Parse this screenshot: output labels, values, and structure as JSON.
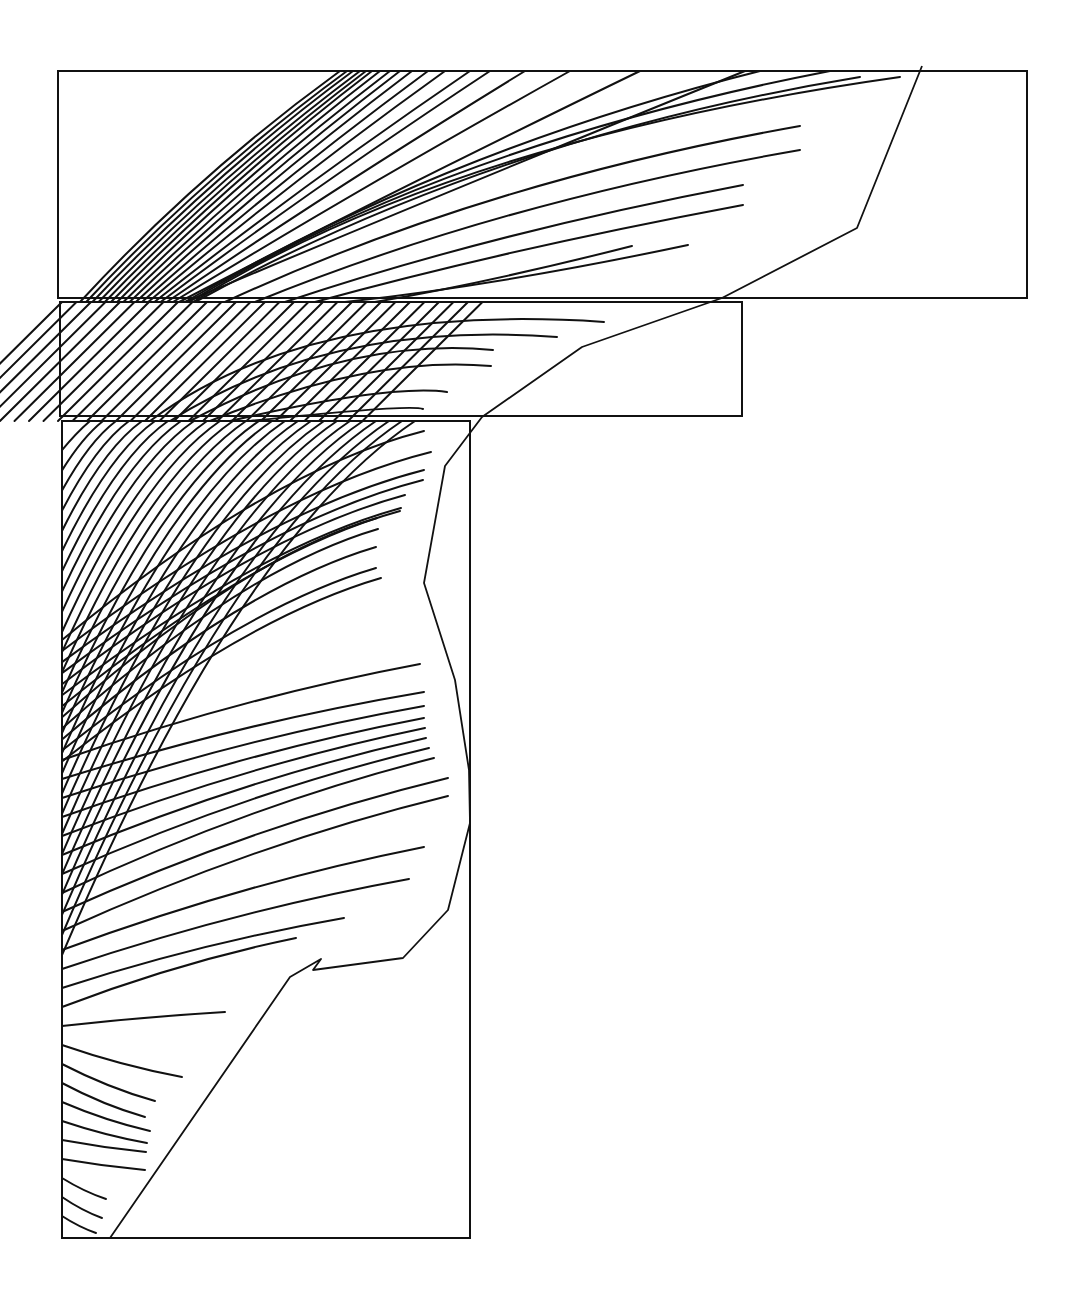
{
  "figure": {
    "type": "slip-line field / streamline diagram",
    "caption": "",
    "caption_visible": "truncated at bottom edge; text not legible",
    "stroke_color": "#111111",
    "background": "#ffffff"
  },
  "frames": [
    {
      "name": "top-block",
      "x": 58,
      "y": 71,
      "width": 969,
      "height": 227
    },
    {
      "name": "middle-block",
      "x": 60,
      "y": 302,
      "width": 682,
      "height": 114
    },
    {
      "name": "bottom-block",
      "x": 62,
      "y": 421,
      "width": 408,
      "height": 817
    }
  ],
  "boundary_polyline": [
    [
      922,
      66
    ],
    [
      857,
      228
    ],
    [
      722,
      298
    ],
    [
      582,
      347
    ],
    [
      482,
      417
    ],
    [
      445,
      466
    ],
    [
      424,
      583
    ],
    [
      455,
      680
    ],
    [
      469,
      770
    ],
    [
      470,
      823
    ],
    [
      448,
      910
    ],
    [
      403,
      958
    ],
    [
      313,
      970
    ],
    [
      321,
      959
    ],
    [
      290,
      977
    ],
    [
      110,
      1238
    ]
  ],
  "streamline_groups": {
    "top": {
      "count": 26,
      "origin_x_range": [
        78,
        210
      ],
      "origin_y": 302,
      "top_edge_hits": [
        340,
        347,
        353,
        360,
        366,
        372,
        380,
        390,
        400,
        412,
        428,
        445,
        470,
        490,
        525,
        570,
        640,
        745
      ],
      "free_ends": [
        [
          860,
          77
        ],
        [
          800,
          126
        ],
        [
          800,
          150
        ],
        [
          743,
          185
        ],
        [
          743,
          205
        ],
        [
          688,
          245
        ],
        [
          632,
          246
        ]
      ]
    },
    "middle": {
      "count": 28,
      "free_ends": [
        [
          604,
          322
        ],
        [
          557,
          337
        ],
        [
          493,
          350
        ],
        [
          491,
          366
        ],
        [
          447,
          392
        ],
        [
          423,
          409
        ]
      ]
    },
    "bottom": {
      "count": 90,
      "left_edge_spacing_px": 8.5,
      "free_ends_upper": [
        [
          424,
          431
        ],
        [
          431,
          452
        ],
        [
          424,
          470
        ],
        [
          423,
          480
        ],
        [
          405,
          495
        ],
        [
          401,
          508
        ],
        [
          400,
          511
        ],
        [
          377,
          518
        ],
        [
          378,
          529
        ],
        [
          376,
          547
        ],
        [
          376,
          568
        ],
        [
          381,
          578
        ]
      ],
      "convergence_point": [
        377,
        574
      ],
      "free_ends_lower": [
        [
          420,
          664
        ],
        [
          424,
          692
        ],
        [
          424,
          706
        ],
        [
          424,
          718
        ],
        [
          425,
          728
        ],
        [
          426,
          738
        ],
        [
          429,
          748
        ],
        [
          434,
          758
        ],
        [
          448,
          778
        ],
        [
          448,
          796
        ],
        [
          424,
          847
        ],
        [
          409,
          879
        ],
        [
          344,
          918
        ],
        [
          296,
          938
        ],
        [
          225,
          1012
        ],
        [
          182,
          1077
        ],
        [
          155,
          1101
        ],
        [
          145,
          1117
        ],
        [
          150,
          1131
        ],
        [
          147,
          1143
        ],
        [
          146,
          1152
        ],
        [
          145,
          1170
        ],
        [
          106,
          1199
        ],
        [
          102,
          1218
        ],
        [
          96,
          1233
        ]
      ]
    }
  }
}
